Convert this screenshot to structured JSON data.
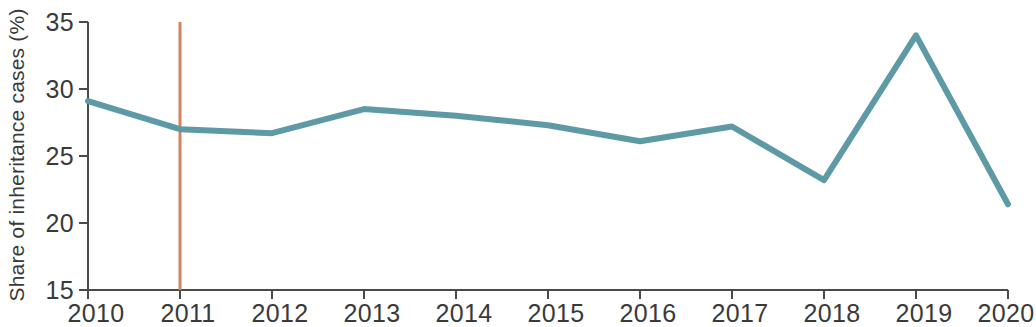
{
  "chart_data": {
    "type": "line",
    "title": "",
    "subtitle": "",
    "xlabel": "",
    "ylabel": "Share of inheritance cases (%)",
    "x": [
      2010,
      2011,
      2012,
      2013,
      2014,
      2015,
      2016,
      2017,
      2018,
      2019,
      2020
    ],
    "xtick_labels": [
      "2010",
      "2011",
      "2012",
      "2013",
      "2014",
      "2015",
      "2016",
      "2017",
      "2018",
      "2019",
      "2020"
    ],
    "ytick_labels": [
      "15",
      "20",
      "25",
      "30",
      "35"
    ],
    "ytick_values": [
      15,
      20,
      25,
      30,
      35
    ],
    "xlim": [
      2010,
      2020
    ],
    "ylim": [
      15,
      35
    ],
    "grid": false,
    "legend": false,
    "legend_position": "none",
    "series": [
      {
        "name": "Share of inheritance cases (%)",
        "color": "#5e9aa6",
        "values": [
          29.1,
          27.0,
          26.7,
          28.5,
          28.0,
          27.3,
          26.1,
          27.2,
          23.2,
          34.0,
          21.4
        ]
      }
    ],
    "annotations": [
      {
        "name": "reference-line-2011",
        "type": "vertical-line",
        "x": 2011,
        "color": "#d9805f",
        "label": ""
      }
    ]
  },
  "axis": {
    "y_label": "Share of inheritance cases (%)",
    "y_ticks": [
      "35",
      "30",
      "25",
      "20",
      "15"
    ],
    "x_ticks": [
      "2010",
      "2011",
      "2012",
      "2013",
      "2014",
      "2015",
      "2016",
      "2017",
      "2018",
      "2019",
      "2020"
    ]
  },
  "colors": {
    "series": "#5e9aa6",
    "reference_line": "#d9805f",
    "axis": "#4a4a4a",
    "text": "#3a3a3a",
    "background": "#ffffff"
  }
}
